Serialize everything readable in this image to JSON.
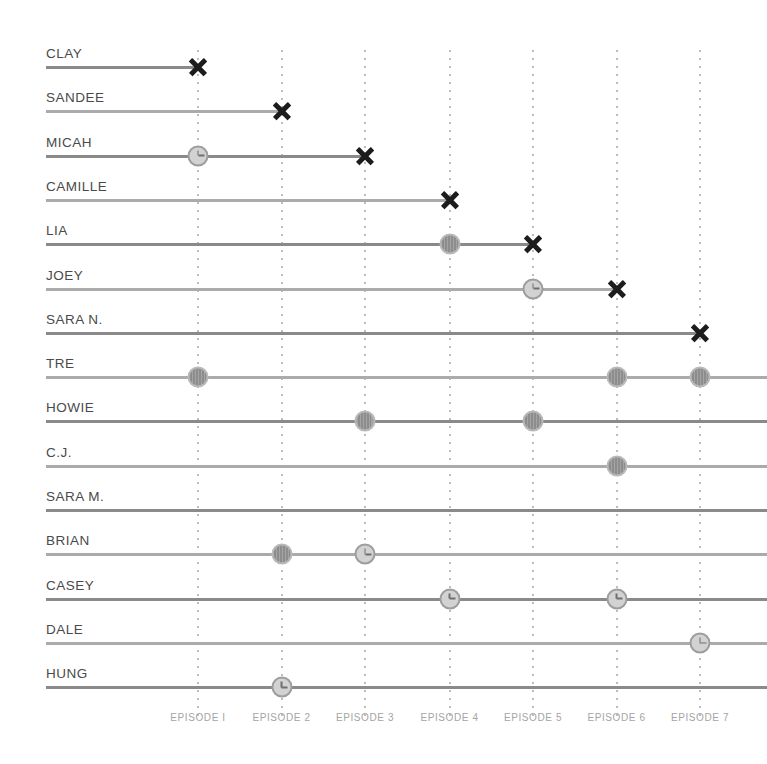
{
  "chart_data": {
    "type": "timeline",
    "title": "",
    "subtitle": "",
    "xlabel": "",
    "ylabel": "",
    "grid": true,
    "legend_position": "none",
    "episode_count": 7,
    "categories": [
      "EPISODE I",
      "EPISODE 2",
      "EPISODE 3",
      "EPISODE 4",
      "EPISODE 5",
      "EPISODE 6",
      "EPISODE 7"
    ],
    "marker_types": {
      "x": "eliminated-x-marker",
      "filled": "filled-circle-marker",
      "clock": "clock-circle-marker"
    },
    "colors": {
      "x_marker": "#1c1c1c",
      "filled_circle": "#8d8d8d",
      "clock_circle": "#d2d2d2",
      "line": "#9a9a9a",
      "gridline": "#bdbdbd",
      "name_text": "#4a4a4a",
      "axis_text": "#a4a4a4"
    },
    "rows": [
      {
        "name": "CLAY",
        "line_end_episode": 1,
        "extends_past": false,
        "markers": [
          {
            "episode": 1,
            "type": "x"
          }
        ]
      },
      {
        "name": "SANDEE",
        "line_end_episode": 2,
        "extends_past": false,
        "markers": [
          {
            "episode": 2,
            "type": "x"
          }
        ]
      },
      {
        "name": "MICAH",
        "line_end_episode": 3,
        "extends_past": false,
        "markers": [
          {
            "episode": 1,
            "type": "clock"
          },
          {
            "episode": 3,
            "type": "x"
          }
        ]
      },
      {
        "name": "CAMILLE",
        "line_end_episode": 4,
        "extends_past": false,
        "markers": [
          {
            "episode": 4,
            "type": "x"
          }
        ]
      },
      {
        "name": "LIA",
        "line_end_episode": 5,
        "extends_past": false,
        "markers": [
          {
            "episode": 4,
            "type": "filled"
          },
          {
            "episode": 5,
            "type": "x"
          }
        ]
      },
      {
        "name": "JOEY",
        "line_end_episode": 6,
        "extends_past": false,
        "markers": [
          {
            "episode": 5,
            "type": "clock"
          },
          {
            "episode": 6,
            "type": "x"
          }
        ]
      },
      {
        "name": "SARA N.",
        "line_end_episode": 7,
        "extends_past": false,
        "markers": [
          {
            "episode": 7,
            "type": "x"
          }
        ]
      },
      {
        "name": "TRE",
        "line_end_episode": 7,
        "extends_past": true,
        "markers": [
          {
            "episode": 1,
            "type": "filled"
          },
          {
            "episode": 6,
            "type": "filled"
          },
          {
            "episode": 7,
            "type": "filled"
          }
        ]
      },
      {
        "name": "HOWIE",
        "line_end_episode": 7,
        "extends_past": true,
        "markers": [
          {
            "episode": 3,
            "type": "filled"
          },
          {
            "episode": 5,
            "type": "filled"
          }
        ]
      },
      {
        "name": "C.J.",
        "line_end_episode": 7,
        "extends_past": true,
        "markers": [
          {
            "episode": 6,
            "type": "filled"
          }
        ]
      },
      {
        "name": "SARA M.",
        "line_end_episode": 7,
        "extends_past": true,
        "markers": []
      },
      {
        "name": "BRIAN",
        "line_end_episode": 7,
        "extends_past": true,
        "markers": [
          {
            "episode": 2,
            "type": "filled"
          },
          {
            "episode": 3,
            "type": "clock"
          }
        ]
      },
      {
        "name": "CASEY",
        "line_end_episode": 7,
        "extends_past": true,
        "markers": [
          {
            "episode": 4,
            "type": "clock"
          },
          {
            "episode": 6,
            "type": "clock"
          }
        ]
      },
      {
        "name": "DALE",
        "line_end_episode": 7,
        "extends_past": true,
        "markers": [
          {
            "episode": 7,
            "type": "clock"
          }
        ]
      },
      {
        "name": "HUNG",
        "line_end_episode": 7,
        "extends_past": true,
        "markers": [
          {
            "episode": 2,
            "type": "clock"
          }
        ]
      }
    ]
  }
}
